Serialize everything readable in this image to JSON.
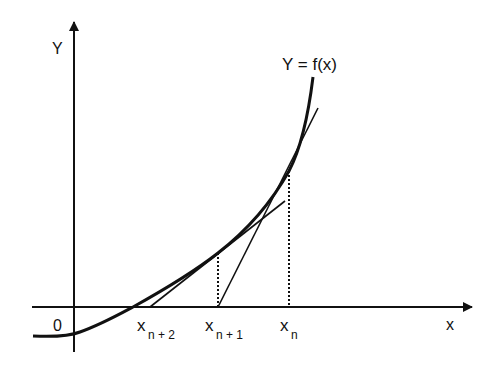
{
  "diagram": {
    "axes": {
      "y_label": "Y",
      "x_label": "x",
      "origin_label": "0"
    },
    "curve_label": "Y = f(x)",
    "points": [
      {
        "base": "x",
        "sub": "n"
      },
      {
        "base": "x",
        "sub": "n + 1"
      },
      {
        "base": "x",
        "sub": "n + 2"
      }
    ],
    "colors": {
      "ink": "#111111",
      "background": "#ffffff"
    }
  }
}
